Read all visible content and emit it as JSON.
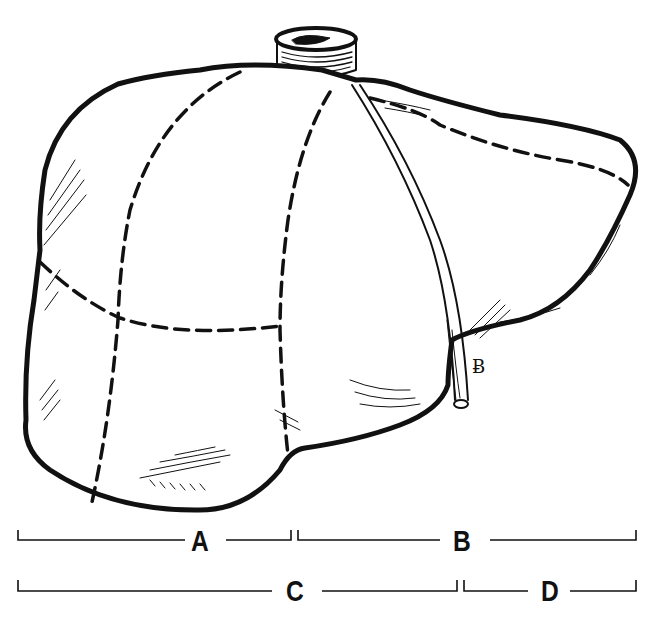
{
  "figure": {
    "colors": {
      "ink": "#111111",
      "background": "#ffffff"
    }
  },
  "brackets": [
    {
      "id": "A",
      "label": "A",
      "row": 1,
      "x_start": 18,
      "x_end": 291
    },
    {
      "id": "B",
      "label": "B",
      "row": 1,
      "x_start": 298,
      "x_end": 636
    },
    {
      "id": "C",
      "label": "C",
      "row": 2,
      "x_start": 18,
      "x_end": 457
    },
    {
      "id": "D",
      "label": "D",
      "row": 2,
      "x_start": 464,
      "x_end": 636
    }
  ],
  "annotations": {
    "artist_signature": "Ƀ"
  }
}
